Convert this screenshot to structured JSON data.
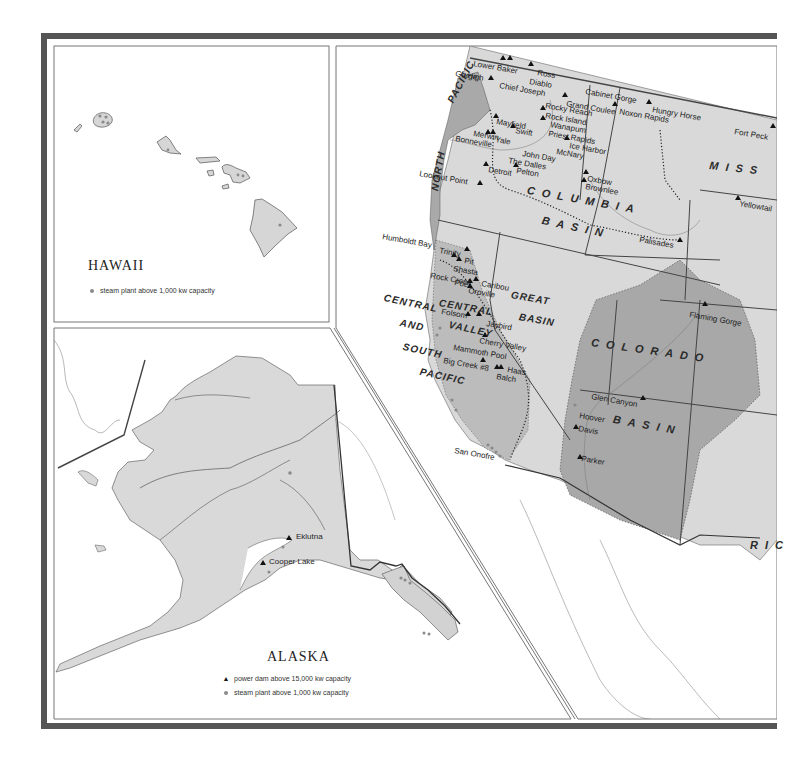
{
  "colors": {
    "frame": "#555555",
    "land_light": "#d9d9d9",
    "basin_mid": "#bcbcbc",
    "basin_dark": "#a7a7a7",
    "water": "#ffffff",
    "line": "#444444",
    "steam_dot": "#8a8a8a",
    "dam_triangle": "#111111"
  },
  "hawaii": {
    "title": "HAWAII",
    "legend": [
      {
        "symbol": "steam-plant-dot",
        "label": "steam plant above 1,000 kw capacity"
      }
    ]
  },
  "alaska": {
    "title": "ALASKA",
    "legend": [
      {
        "symbol": "power-dam-triangle",
        "label": "power dam above 15,000 kw capacity"
      },
      {
        "symbol": "steam-plant-dot",
        "label": "steam plant above 1,000 kw capacity"
      }
    ],
    "dams": [
      {
        "name": "Eklutna",
        "x": 291,
        "y": 536
      },
      {
        "name": "Cooper Lake",
        "x": 264,
        "y": 561
      }
    ]
  },
  "west": {
    "regions": [
      {
        "name": "PACIFIC",
        "x": 446,
        "y": 100,
        "rotate": -62,
        "tight": true
      },
      {
        "name": "NORTH",
        "x": 430,
        "y": 190,
        "rotate": -80,
        "tight": true
      },
      {
        "name": "COLUMBIA",
        "x": 528,
        "y": 185,
        "rotate": 10
      },
      {
        "name": "BASIN",
        "x": 543,
        "y": 215,
        "rotate": 12
      },
      {
        "name": "GREAT",
        "x": 512,
        "y": 290,
        "rotate": 10,
        "tight": true
      },
      {
        "name": "BASIN",
        "x": 520,
        "y": 312,
        "rotate": 10,
        "tight": true
      },
      {
        "name": "CENTRAL",
        "x": 385,
        "y": 293,
        "rotate": 12,
        "tight": true
      },
      {
        "name": "AND",
        "x": 401,
        "y": 318,
        "rotate": 12,
        "tight": true
      },
      {
        "name": "SOUTH",
        "x": 404,
        "y": 342,
        "rotate": 12,
        "tight": true
      },
      {
        "name": "PACIFIC",
        "x": 421,
        "y": 367,
        "rotate": 12,
        "tight": true
      },
      {
        "name": "CENTRAL",
        "x": 440,
        "y": 298,
        "rotate": 10,
        "tight": true
      },
      {
        "name": "VALLEY",
        "x": 450,
        "y": 320,
        "rotate": 12,
        "tight": true
      },
      {
        "name": "COLORADO",
        "x": 592,
        "y": 337,
        "rotate": 8
      },
      {
        "name": "BASIN",
        "x": 614,
        "y": 414,
        "rotate": 10
      },
      {
        "name": "MISS",
        "x": 710,
        "y": 160,
        "rotate": 6
      },
      {
        "name": "RIC",
        "x": 750,
        "y": 540,
        "rotate": 0
      }
    ],
    "dams": [
      {
        "name": "Lower Baker",
        "x": 474,
        "y": 60
      },
      {
        "name": "Gorge",
        "x": 456,
        "y": 70
      },
      {
        "name": "High",
        "x": 468,
        "y": 72
      },
      {
        "name": "Chief Joseph",
        "x": 500,
        "y": 82
      },
      {
        "name": "Ross",
        "x": 538,
        "y": 69
      },
      {
        "name": "Diablo",
        "x": 530,
        "y": 78
      },
      {
        "name": "Cabinet Gorge",
        "x": 586,
        "y": 88
      },
      {
        "name": "Grand Coulee",
        "x": 567,
        "y": 100
      },
      {
        "name": "Noxon Rapids",
        "x": 620,
        "y": 108
      },
      {
        "name": "Hungry Horse",
        "x": 653,
        "y": 106
      },
      {
        "name": "Fort Peck",
        "x": 735,
        "y": 128
      },
      {
        "name": "Rocky Reach",
        "x": 546,
        "y": 102
      },
      {
        "name": "Rock Island",
        "x": 546,
        "y": 112
      },
      {
        "name": "Wanapum",
        "x": 551,
        "y": 121
      },
      {
        "name": "Priest Rapids",
        "x": 549,
        "y": 130
      },
      {
        "name": "Mayfield",
        "x": 497,
        "y": 118
      },
      {
        "name": "Swift",
        "x": 516,
        "y": 127
      },
      {
        "name": "Merwin",
        "x": 474,
        "y": 130
      },
      {
        "name": "Yale",
        "x": 496,
        "y": 136
      },
      {
        "name": "Bonneville",
        "x": 456,
        "y": 135
      },
      {
        "name": "Ice Harbor",
        "x": 570,
        "y": 142
      },
      {
        "name": "McNary",
        "x": 557,
        "y": 148
      },
      {
        "name": "John Day",
        "x": 523,
        "y": 150
      },
      {
        "name": "The Dalles",
        "x": 509,
        "y": 157
      },
      {
        "name": "Detroit",
        "x": 489,
        "y": 166
      },
      {
        "name": "Pelton",
        "x": 517,
        "y": 167
      },
      {
        "name": "Lookout Point",
        "x": 420,
        "y": 170
      },
      {
        "name": "Oxbow",
        "x": 588,
        "y": 175
      },
      {
        "name": "Brownlee",
        "x": 586,
        "y": 183
      },
      {
        "name": "Yellowtail",
        "x": 740,
        "y": 200
      },
      {
        "name": "Palisades",
        "x": 640,
        "y": 236
      },
      {
        "name": "Humboldt Bay",
        "x": 383,
        "y": 233
      },
      {
        "name": "Trinity",
        "x": 440,
        "y": 247
      },
      {
        "name": "Pit",
        "x": 465,
        "y": 257
      },
      {
        "name": "Shasta",
        "x": 454,
        "y": 265
      },
      {
        "name": "Rock Creek",
        "x": 431,
        "y": 272
      },
      {
        "name": "Poe",
        "x": 455,
        "y": 279
      },
      {
        "name": "Caribou",
        "x": 482,
        "y": 280
      },
      {
        "name": "Oroville",
        "x": 469,
        "y": 287
      },
      {
        "name": "Folsom",
        "x": 442,
        "y": 308
      },
      {
        "name": "Jaybird",
        "x": 487,
        "y": 320
      },
      {
        "name": "Flaming Gorge",
        "x": 690,
        "y": 311
      },
      {
        "name": "Cherry Valley",
        "x": 480,
        "y": 337
      },
      {
        "name": "Mammoth Pool",
        "x": 454,
        "y": 344
      },
      {
        "name": "Big Creek #8",
        "x": 444,
        "y": 357
      },
      {
        "name": "Haas",
        "x": 508,
        "y": 366
      },
      {
        "name": "Balch",
        "x": 497,
        "y": 373
      },
      {
        "name": "Glen Canyon",
        "x": 592,
        "y": 393
      },
      {
        "name": "Hoover",
        "x": 580,
        "y": 412
      },
      {
        "name": "Davis",
        "x": 579,
        "y": 425
      },
      {
        "name": "Parker",
        "x": 582,
        "y": 455
      },
      {
        "name": "San Onofre",
        "x": 455,
        "y": 447
      }
    ]
  }
}
